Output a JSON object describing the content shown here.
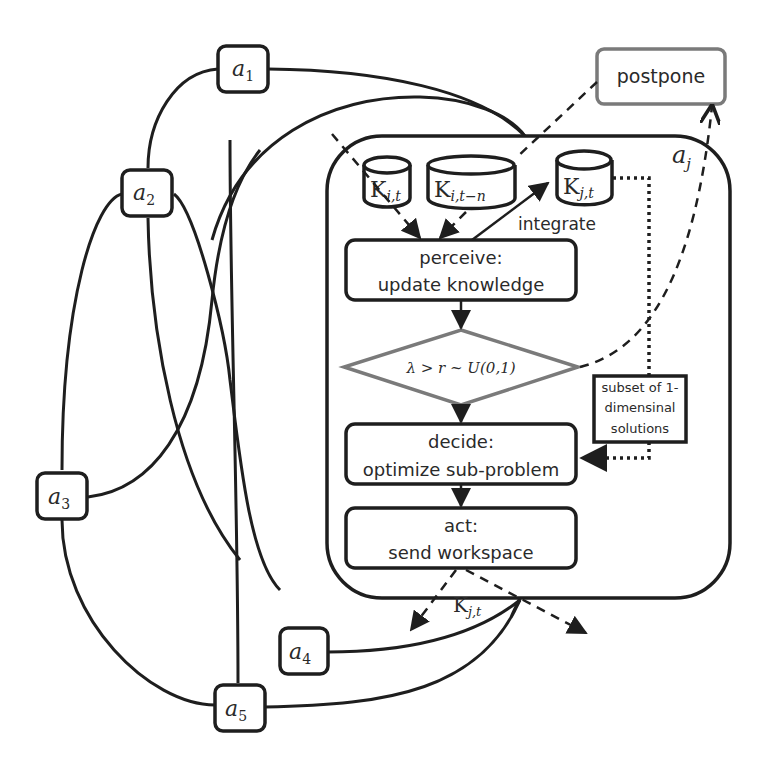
{
  "diagram": {
    "agents": [
      {
        "id": "a1",
        "base": "a",
        "sub": "1"
      },
      {
        "id": "a2",
        "base": "a",
        "sub": "2"
      },
      {
        "id": "a3",
        "base": "a",
        "sub": "3"
      },
      {
        "id": "a4",
        "base": "a",
        "sub": "4"
      },
      {
        "id": "a5",
        "base": "a",
        "sub": "5"
      }
    ],
    "agent_j": {
      "base": "a",
      "sub": "j"
    },
    "knowledge_stores": [
      {
        "id": "k-it",
        "base": "K",
        "sub": "i,t"
      },
      {
        "id": "k-itn",
        "base": "K",
        "sub": "i,t−n"
      },
      {
        "id": "k-jt",
        "base": "K",
        "sub": "j,t"
      }
    ],
    "postpone_label": "postpone",
    "integrate_label": "integrate",
    "perceive": {
      "line1": "perceive:",
      "line2": "update knowledge"
    },
    "condition": "λ > r ~ U(0,1)",
    "subset_box": {
      "line1": "subset of 1-",
      "line2": "dimensinal",
      "line3": "solutions"
    },
    "decide": {
      "line1": "decide:",
      "line2": "optimize sub-problem"
    },
    "act": {
      "line1": "act:",
      "line2": "send workspace"
    },
    "output_label": {
      "base": "K",
      "sub": "j,t"
    },
    "colors": {
      "stroke": "#1e1e1e",
      "gray_stroke": "#7a7a7a",
      "background": "#ffffff"
    }
  }
}
